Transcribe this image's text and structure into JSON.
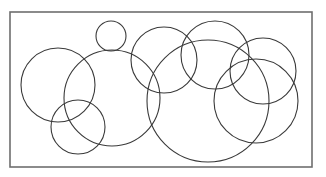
{
  "diagram": {
    "type": "overlapping-circles",
    "colors": {
      "background": "#ffffff",
      "frame": "#6e6e6e",
      "stroke": "#3a3a3a"
    },
    "frame": {
      "x": 10,
      "y": 12,
      "width": 302,
      "height": 155
    },
    "circles": [
      {
        "id": "circle-left",
        "cx": 58,
        "cy": 85,
        "r": 37
      },
      {
        "id": "circle-left-center-large",
        "cx": 112,
        "cy": 98,
        "r": 48
      },
      {
        "id": "circle-top-small",
        "cx": 111,
        "cy": 36,
        "r": 15
      },
      {
        "id": "circle-bottom-left",
        "cx": 78,
        "cy": 127,
        "r": 27
      },
      {
        "id": "circle-center-upper",
        "cx": 164,
        "cy": 60,
        "r": 33
      },
      {
        "id": "circle-center-right-upper",
        "cx": 215,
        "cy": 55,
        "r": 34
      },
      {
        "id": "circle-center-large",
        "cx": 208,
        "cy": 101,
        "r": 61
      },
      {
        "id": "circle-right-upper",
        "cx": 263,
        "cy": 71,
        "r": 33
      },
      {
        "id": "circle-right-lower",
        "cx": 256,
        "cy": 101,
        "r": 42
      }
    ]
  }
}
